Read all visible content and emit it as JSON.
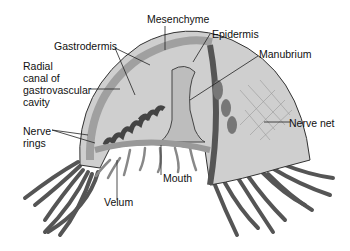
{
  "figure": {
    "labels": {
      "mesenchyme": "Mesenchyme",
      "epidermis": "Epidermis",
      "gastrodermis": "Gastrodermis",
      "manubrium": "Manubrium",
      "radial_canal": "Radial\ncanal of\ngastrovascular\ncavity",
      "nerve_net": "Nerve net",
      "nerve_rings": "Nerve\nrings",
      "mouth": "Mouth",
      "velum": "Velum"
    },
    "colors": {
      "bell_fill": "#c9c9c9",
      "bell_light": "#dcdcdc",
      "mesoglea_band": "#a8a8a8",
      "gastrodermis_dark": "#555555",
      "outline": "#333333",
      "background": "#ffffff"
    }
  }
}
